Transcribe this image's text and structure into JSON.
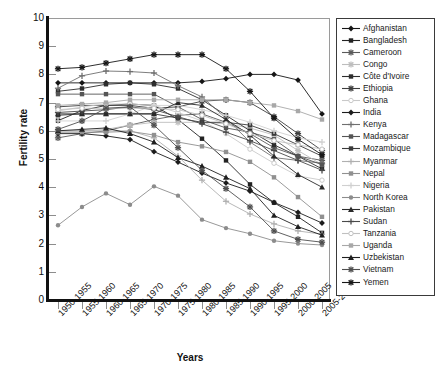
{
  "chart_data": {
    "type": "line",
    "title": "",
    "xlabel": "Years",
    "ylabel": "Fertility rate",
    "ylim": [
      0,
      10
    ],
    "yticks": [
      0,
      1,
      2,
      3,
      4,
      5,
      6,
      7,
      8,
      9,
      10
    ],
    "grid": false,
    "legend_position": "right",
    "categories": [
      "1950-1955",
      "1955-1960",
      "1960-1965",
      "1965-1970",
      "1970-1975",
      "1975-1980",
      "1980-1985",
      "1985-1990",
      "1990-1995",
      "1995-2000",
      "2000-2005",
      "2005-2010"
    ],
    "series": [
      {
        "name": "Afghanistan",
        "marker": "diamond",
        "color": "#151515",
        "values": [
          7.7,
          7.7,
          7.7,
          7.7,
          7.7,
          7.7,
          7.75,
          7.85,
          8.0,
          8.0,
          7.8,
          6.6
        ]
      },
      {
        "name": "Bangladesh",
        "marker": "square",
        "color": "#222222",
        "values": [
          6.36,
          6.72,
          6.9,
          6.95,
          6.9,
          6.4,
          5.72,
          4.95,
          4.1,
          3.45,
          2.95,
          2.38
        ]
      },
      {
        "name": "Cameroon",
        "marker": "cross",
        "color": "#5a5a5a",
        "values": [
          5.75,
          5.9,
          6.0,
          6.2,
          6.4,
          6.55,
          6.6,
          6.3,
          5.9,
          5.4,
          5.1,
          4.95
        ]
      },
      {
        "name": "Congo",
        "marker": "cross",
        "color": "#bdbdbd",
        "values": [
          6.0,
          6.0,
          6.05,
          6.2,
          6.3,
          6.3,
          6.3,
          6.25,
          6.1,
          5.85,
          5.3,
          4.8
        ]
      },
      {
        "name": "Côte d'Ivoire",
        "marker": "square",
        "color": "#2d2d2d",
        "values": [
          7.4,
          7.5,
          7.65,
          7.7,
          7.65,
          7.5,
          7.1,
          6.55,
          6.0,
          5.5,
          5.1,
          4.65
        ]
      },
      {
        "name": "Ethiopia",
        "marker": "cross",
        "color": "#3d3d3d",
        "values": [
          6.85,
          6.9,
          6.9,
          6.9,
          6.8,
          6.85,
          7.05,
          7.1,
          7.0,
          6.5,
          5.9,
          5.3
        ]
      },
      {
        "name": "Ghana",
        "marker": "circle-open",
        "color": "#c9c9c9",
        "values": [
          6.7,
          6.85,
          6.95,
          6.95,
          6.9,
          6.65,
          6.35,
          5.9,
          5.35,
          4.85,
          4.4,
          4.25
        ]
      },
      {
        "name": "India",
        "marker": "diamond",
        "color": "#1c1c1c",
        "values": [
          5.9,
          5.9,
          5.82,
          5.69,
          5.26,
          4.89,
          4.5,
          4.15,
          3.86,
          3.46,
          3.11,
          2.73
        ]
      },
      {
        "name": "Kenya",
        "marker": "plus",
        "color": "#6f6f6f",
        "values": [
          7.51,
          7.95,
          8.12,
          8.1,
          8.05,
          7.6,
          7.2,
          6.45,
          5.6,
          5.05,
          4.95,
          4.85
        ]
      },
      {
        "name": "Madagascar",
        "marker": "square",
        "color": "#555555",
        "values": [
          7.3,
          7.3,
          7.3,
          7.3,
          7.3,
          6.85,
          6.4,
          6.1,
          5.95,
          5.7,
          5.1,
          4.8
        ]
      },
      {
        "name": "Mozambique",
        "marker": "square",
        "color": "#3a3a3a",
        "values": [
          6.55,
          6.6,
          6.6,
          6.6,
          6.6,
          6.45,
          6.3,
          6.3,
          6.2,
          5.9,
          5.5,
          5.1
        ]
      },
      {
        "name": "Myanmar",
        "marker": "plus",
        "color": "#b0b0b0",
        "values": [
          6.0,
          6.0,
          6.0,
          6.0,
          5.75,
          5.1,
          4.25,
          3.5,
          3.05,
          2.7,
          2.45,
          2.33
        ]
      },
      {
        "name": "Nepal",
        "marker": "square",
        "color": "#909090",
        "values": [
          5.95,
          5.95,
          5.95,
          5.98,
          5.85,
          5.6,
          5.45,
          5.25,
          4.9,
          4.35,
          3.65,
          2.95
        ]
      },
      {
        "name": "Nigeria",
        "marker": "plus",
        "color": "#d0d0d0",
        "values": [
          6.35,
          6.35,
          6.35,
          6.6,
          6.9,
          6.9,
          6.75,
          6.55,
          6.3,
          6.0,
          5.75,
          5.6
        ]
      },
      {
        "name": "North Korea",
        "marker": "circle",
        "color": "#8c8c8c",
        "values": [
          2.65,
          3.3,
          3.78,
          3.38,
          4.03,
          3.7,
          2.85,
          2.55,
          2.35,
          2.1,
          2.0,
          1.95
        ]
      },
      {
        "name": "Pakistan",
        "marker": "triangle",
        "color": "#2a2a2a",
        "values": [
          6.6,
          6.6,
          6.6,
          6.6,
          6.6,
          7.0,
          6.9,
          6.4,
          5.85,
          5.1,
          4.45,
          4.0
        ]
      },
      {
        "name": "Sudan",
        "marker": "plus",
        "color": "#4a4a4a",
        "values": [
          6.65,
          6.7,
          6.75,
          6.85,
          6.75,
          6.5,
          6.25,
          5.95,
          5.65,
          5.3,
          4.95,
          4.6
        ]
      },
      {
        "name": "Tanzania",
        "marker": "circle-open",
        "color": "#c0c0c0",
        "values": [
          6.75,
          6.8,
          6.8,
          6.8,
          6.8,
          6.75,
          6.55,
          6.25,
          5.9,
          5.65,
          5.5,
          5.35
        ]
      },
      {
        "name": "Uganda",
        "marker": "square",
        "color": "#a8a8a8",
        "values": [
          6.9,
          6.95,
          7.0,
          7.1,
          7.1,
          7.1,
          7.1,
          7.1,
          7.0,
          6.9,
          6.7,
          6.4
        ]
      },
      {
        "name": "Uzbekistan",
        "marker": "triangle",
        "color": "#1f1f1f",
        "values": [
          6.0,
          6.05,
          6.1,
          5.9,
          5.6,
          5.05,
          4.75,
          4.35,
          3.95,
          3.0,
          2.6,
          2.3
        ]
      },
      {
        "name": "Vietnam",
        "marker": "cross",
        "color": "#4f4f4f",
        "values": [
          6.05,
          6.35,
          6.8,
          6.85,
          6.2,
          5.4,
          4.6,
          3.95,
          3.3,
          2.45,
          2.15,
          2.05
        ]
      },
      {
        "name": "Yemen",
        "marker": "cross",
        "color": "#171717",
        "values": [
          8.2,
          8.25,
          8.4,
          8.55,
          8.7,
          8.7,
          8.7,
          8.2,
          7.4,
          6.45,
          5.7,
          5.15
        ]
      }
    ]
  },
  "axes": {
    "y_tick_labels": [
      "0",
      "1",
      "2",
      "3",
      "4",
      "5",
      "6",
      "7",
      "8",
      "9",
      "10"
    ],
    "y_axis_title": "Fertility rate",
    "x_axis_title": "Years",
    "x_tick_labels": [
      "1950-1955",
      "1955-1960",
      "1960-1965",
      "1965-1970",
      "1970-1975",
      "1975-1980",
      "1980-1985",
      "1985-1990",
      "1990-1995",
      "1995-2000",
      "2000-2005",
      "2005-2010"
    ]
  },
  "legend": {
    "entries": [
      "Afghanistan",
      "Bangladesh",
      "Cameroon",
      "Congo",
      "Côte d'Ivoire",
      "Ethiopia",
      "Ghana",
      "India",
      "Kenya",
      "Madagascar",
      "Mozambique",
      "Myanmar",
      "Nepal",
      "Nigeria",
      "North Korea",
      "Pakistan",
      "Sudan",
      "Tanzania",
      "Uganda",
      "Uzbekistan",
      "Vietnam",
      "Yemen"
    ]
  }
}
